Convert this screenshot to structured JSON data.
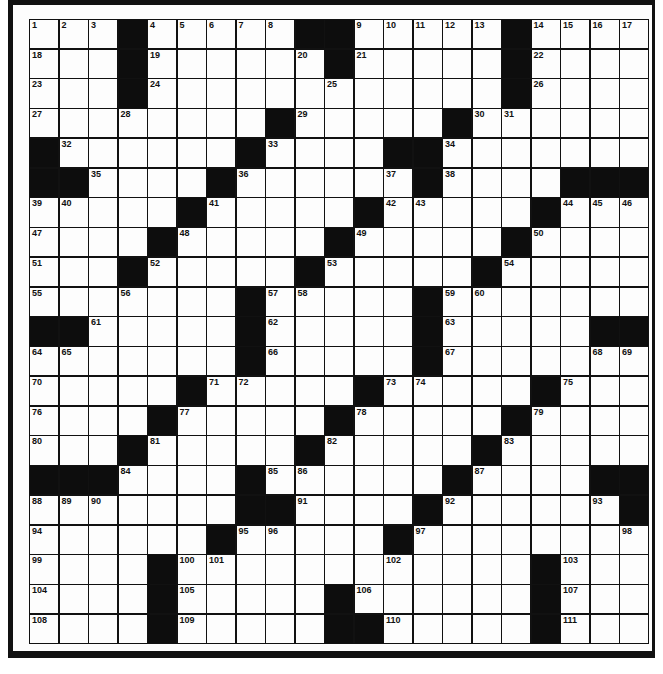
{
  "puzzle": {
    "type": "crossword",
    "rows": 21,
    "cols": 21,
    "grid": [
      [
        "1",
        "2",
        "3",
        "#",
        "4",
        "5",
        "6",
        "7",
        "8",
        "#",
        "#",
        "9",
        "10",
        "11",
        "12",
        "13",
        "#",
        "14",
        "15",
        "16",
        "17"
      ],
      [
        "18",
        "",
        "",
        "#",
        "19",
        "",
        "",
        "",
        "",
        "20",
        "#",
        "21",
        "",
        "",
        "",
        "",
        "#",
        "22",
        "",
        "",
        ""
      ],
      [
        "23",
        "",
        "",
        "#",
        "24",
        "",
        "",
        "",
        "",
        "",
        "25",
        "",
        "",
        "",
        "",
        "",
        "#",
        "26",
        "",
        "",
        ""
      ],
      [
        "27",
        "",
        "",
        "28",
        "",
        "",
        "",
        "",
        "#",
        "29",
        "",
        "",
        "",
        "",
        "#",
        "30",
        "31",
        "",
        "",
        "",
        ""
      ],
      [
        "#",
        "32",
        "",
        "",
        "",
        "",
        "",
        "#",
        "33",
        "",
        "",
        "",
        "#",
        "#",
        "34",
        "",
        "",
        "",
        "",
        "",
        ""
      ],
      [
        "#",
        "#",
        "35",
        "",
        "",
        "",
        "#",
        "36",
        "",
        "",
        "",
        "",
        "37",
        "#",
        "38",
        "",
        "",
        "",
        "#",
        "#",
        "#"
      ],
      [
        "39",
        "40",
        "",
        "",
        "",
        "#",
        "41",
        "",
        "",
        "",
        "",
        "#",
        "42",
        "43",
        "",
        "",
        "",
        "#",
        "44",
        "45",
        "46"
      ],
      [
        "47",
        "",
        "",
        "",
        "#",
        "48",
        "",
        "",
        "",
        "",
        "#",
        "49",
        "",
        "",
        "",
        "",
        "#",
        "50",
        "",
        "",
        ""
      ],
      [
        "51",
        "",
        "",
        "#",
        "52",
        "",
        "",
        "",
        "",
        "#",
        "53",
        "",
        "",
        "",
        "",
        "#",
        "54",
        "",
        "",
        "",
        ""
      ],
      [
        "55",
        "",
        "",
        "56",
        "",
        "",
        "",
        "#",
        "57",
        "58",
        "",
        "",
        "",
        "#",
        "59",
        "60",
        "",
        "",
        "",
        "",
        ""
      ],
      [
        "#",
        "#",
        "61",
        "",
        "",
        "",
        "",
        "#",
        "62",
        "",
        "",
        "",
        "",
        "#",
        "63",
        "",
        "",
        "",
        "",
        "#",
        "#"
      ],
      [
        "64",
        "65",
        "",
        "",
        "",
        "",
        "",
        "#",
        "66",
        "",
        "",
        "",
        "",
        "#",
        "67",
        "",
        "",
        "",
        "",
        "68",
        "69"
      ],
      [
        "70",
        "",
        "",
        "",
        "",
        "#",
        "71",
        "72",
        "",
        "",
        "",
        "#",
        "73",
        "74",
        "",
        "",
        "",
        "#",
        "75",
        "",
        ""
      ],
      [
        "76",
        "",
        "",
        "",
        "#",
        "77",
        "",
        "",
        "",
        "",
        "#",
        "78",
        "",
        "",
        "",
        "",
        "#",
        "79",
        "",
        "",
        ""
      ],
      [
        "80",
        "",
        "",
        "#",
        "81",
        "",
        "",
        "",
        "",
        "#",
        "82",
        "",
        "",
        "",
        "",
        "#",
        "83",
        "",
        "",
        "",
        ""
      ],
      [
        "#",
        "#",
        "#",
        "84",
        "",
        "",
        "",
        "#",
        "85",
        "86",
        "",
        "",
        "",
        "",
        "#",
        "87",
        "",
        "",
        "",
        "#",
        "#"
      ],
      [
        "88",
        "89",
        "90",
        "",
        "",
        "",
        "",
        "#",
        "#",
        "91",
        "",
        "",
        "",
        "#",
        "92",
        "",
        "",
        "",
        "",
        "93",
        "#"
      ],
      [
        "94",
        "",
        "",
        "",
        "",
        "",
        "#",
        "95",
        "96",
        "",
        "",
        "",
        "#",
        "97",
        "",
        "",
        "",
        "",
        "",
        "",
        "98"
      ],
      [
        "99",
        "",
        "",
        "",
        "#",
        "100",
        "101",
        "",
        "",
        "",
        "",
        "",
        "102",
        "",
        "",
        "",
        "",
        "#",
        "103",
        "",
        ""
      ],
      [
        "104",
        "",
        "",
        "",
        "#",
        "105",
        "",
        "",
        "",
        "",
        "#",
        "106",
        "",
        "",
        "",
        "",
        "",
        "#",
        "107",
        "",
        ""
      ],
      [
        "108",
        "",
        "",
        "",
        "#",
        "109",
        "",
        "",
        "",
        "",
        "#",
        "#",
        "110",
        "",
        "",
        "",
        "",
        "#",
        "111",
        "",
        ""
      ]
    ]
  }
}
